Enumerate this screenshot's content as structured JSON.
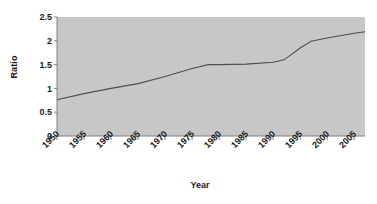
{
  "chart_data": {
    "type": "line",
    "title": "",
    "xlabel": "Year",
    "ylabel": "Ratio",
    "xlim": [
      1950,
      2007
    ],
    "ylim": [
      0,
      2.5
    ],
    "grid": false,
    "legend": "none",
    "background_color": "#c7c7c7",
    "line_color": "#4d4d4d",
    "axis_color": "#808080",
    "text_color": "#1a1a1a",
    "ytick_labels": [
      "2.5",
      "2",
      "1.5",
      "1",
      "0.5",
      "0"
    ],
    "ytick_values": [
      2.5,
      2,
      1.5,
      1,
      0.5,
      0
    ],
    "xtick_labels": [
      "1950",
      "1955",
      "1960",
      "1965",
      "1970",
      "1975",
      "1980",
      "1985",
      "1990",
      "1995",
      "2000",
      "2005"
    ],
    "xtick_values": [
      1950,
      1955,
      1960,
      1965,
      1970,
      1975,
      1980,
      1985,
      1990,
      1995,
      2000,
      2005
    ],
    "series": [
      {
        "name": "Ratio",
        "x": [
          1950,
          1955,
          1960,
          1965,
          1970,
          1975,
          1978,
          1980,
          1985,
          1990,
          1992,
          1995,
          1997,
          2000,
          2005,
          2007
        ],
        "values": [
          0.76,
          0.89,
          1.0,
          1.1,
          1.25,
          1.42,
          1.5,
          1.5,
          1.51,
          1.55,
          1.6,
          1.85,
          1.99,
          2.06,
          2.16,
          2.19
        ]
      }
    ]
  }
}
